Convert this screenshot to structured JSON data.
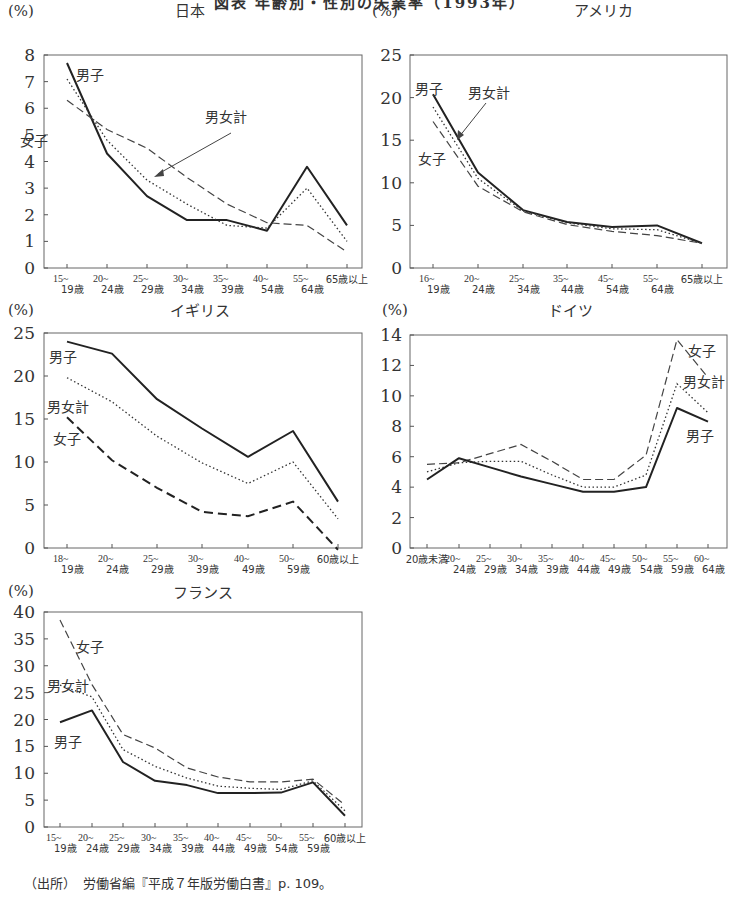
{
  "page_title": "図表 年齢別・性別の失業率（1993年）",
  "source_text": "（出所）　労働省編『平成７年版労働白書』p. 109。",
  "legend_names": {
    "male": "男子",
    "female": "女子",
    "total": "男女計"
  },
  "unit": "(%)",
  "chart_data": [
    {
      "type": "line",
      "title": "日本",
      "ylabel": "(%)",
      "ylim": [
        0,
        8
      ],
      "yticks": [
        0,
        1,
        2,
        3,
        4,
        5,
        6,
        7,
        8
      ],
      "categories": [
        "15~19歳",
        "20~24歳",
        "25~29歳",
        "30~34歳",
        "35~39歳",
        "40~54歳",
        "55~64歳",
        "65歳以上"
      ],
      "series": [
        {
          "name": "男子",
          "style": "solid",
          "values": [
            7.7,
            4.3,
            2.7,
            1.8,
            1.8,
            1.4,
            3.8,
            1.6
          ]
        },
        {
          "name": "女子",
          "style": "dashed",
          "values": [
            6.3,
            5.2,
            4.5,
            3.4,
            2.4,
            1.7,
            1.6,
            0.6
          ]
        },
        {
          "name": "男女計",
          "style": "dotted",
          "values": [
            7.1,
            4.8,
            3.3,
            2.4,
            1.6,
            1.5,
            3.0,
            1.0
          ]
        }
      ],
      "annotations": [
        "男子",
        "女子",
        "男女計 (arrow)"
      ],
      "grid": false
    },
    {
      "type": "line",
      "title": "アメリカ",
      "ylabel": "(%)",
      "ylim": [
        0,
        25
      ],
      "yticks": [
        0,
        5,
        10,
        15,
        20,
        25
      ],
      "categories": [
        "16~19歳",
        "20~24歳",
        "25~34歳",
        "35~44歳",
        "45~54歳",
        "55~64歳",
        "65歳以上"
      ],
      "series": [
        {
          "name": "男子",
          "style": "solid",
          "values": [
            20.4,
            11.2,
            6.8,
            5.4,
            4.8,
            5.0,
            2.9
          ]
        },
        {
          "name": "女子",
          "style": "dashed",
          "values": [
            17.2,
            9.6,
            6.6,
            5.1,
            4.3,
            3.8,
            2.9
          ]
        },
        {
          "name": "男女計",
          "style": "dotted",
          "values": [
            18.9,
            10.5,
            6.7,
            5.3,
            4.6,
            4.5,
            2.9
          ]
        }
      ],
      "annotations": [
        "男子",
        "女子",
        "男女計 (arrow)"
      ],
      "grid": false
    },
    {
      "type": "line",
      "title": "イギリス",
      "ylabel": "(%)",
      "ylim": [
        0,
        25
      ],
      "yticks": [
        0,
        5,
        10,
        15,
        20,
        25
      ],
      "categories": [
        "18~19歳",
        "20~24歳",
        "25~29歳",
        "30~39歳",
        "40~49歳",
        "50~59歳",
        "60歳以上"
      ],
      "series": [
        {
          "name": "男子",
          "style": "solid",
          "values": [
            24.0,
            22.6,
            17.3,
            13.9,
            10.6,
            13.6,
            5.4
          ]
        },
        {
          "name": "男女計",
          "style": "dotted",
          "values": [
            19.8,
            17.0,
            13.0,
            9.9,
            7.5,
            10.0,
            3.4
          ]
        },
        {
          "name": "女子",
          "style": "dashed",
          "values": [
            15.2,
            10.2,
            7.0,
            4.2,
            3.7,
            5.4,
            -0.2
          ]
        }
      ],
      "annotations": [
        "男子",
        "男女計",
        "女子"
      ],
      "grid": false
    },
    {
      "type": "line",
      "title": "ドイツ",
      "ylabel": "(%)",
      "ylim": [
        0,
        14
      ],
      "yticks": [
        0,
        2,
        4,
        6,
        8,
        10,
        12,
        14
      ],
      "categories": [
        "20歳未満",
        "20~24歳",
        "25~29歳",
        "30~34歳",
        "35~39歳",
        "40~44歳",
        "45~49歳",
        "50~54歳",
        "55~59歳",
        "60~64歳"
      ],
      "series": [
        {
          "name": "女子",
          "style": "dashed",
          "values": [
            5.5,
            5.6,
            6.2,
            6.8,
            5.7,
            4.5,
            4.5,
            6.1,
            13.7,
            11.2
          ]
        },
        {
          "name": "男女計",
          "style": "dotted",
          "values": [
            5.0,
            5.6,
            5.7,
            5.7,
            4.8,
            4.0,
            4.0,
            4.8,
            10.8,
            8.9
          ]
        },
        {
          "name": "男子",
          "style": "solid",
          "values": [
            4.5,
            5.9,
            5.3,
            4.7,
            4.2,
            3.7,
            3.7,
            4.0,
            9.2,
            8.3
          ]
        }
      ],
      "annotations": [
        "女子",
        "男女計",
        "男子"
      ],
      "grid": false
    },
    {
      "type": "line",
      "title": "フランス",
      "ylabel": "(%)",
      "ylim": [
        0,
        40
      ],
      "yticks": [
        0,
        5,
        10,
        15,
        20,
        25,
        30,
        35,
        40
      ],
      "categories": [
        "15~19歳",
        "20~24歳",
        "25~29歳",
        "30~34歳",
        "35~39歳",
        "40~44歳",
        "45~49歳",
        "50~54歳",
        "55~59歳",
        "60歳以上"
      ],
      "series": [
        {
          "name": "女子",
          "style": "dashed",
          "values": [
            38.5,
            26.5,
            17.2,
            14.7,
            11.0,
            9.3,
            8.4,
            8.4,
            8.9,
            4.1
          ]
        },
        {
          "name": "男女計",
          "style": "dotted",
          "values": [
            26.4,
            24.2,
            14.4,
            11.3,
            9.1,
            7.6,
            7.2,
            7.0,
            8.6,
            3.0
          ]
        },
        {
          "name": "男子",
          "style": "solid",
          "values": [
            19.5,
            21.7,
            12.1,
            8.6,
            7.8,
            6.3,
            6.3,
            6.4,
            8.3,
            2.1
          ]
        }
      ],
      "annotations": [
        "女子",
        "男女計",
        "男子"
      ],
      "grid": false
    }
  ],
  "layout": {
    "charts": [
      {
        "x0": 44,
        "x1": 362,
        "ytop": 55,
        "ybot": 268,
        "unit_x": 8,
        "unit_y": 16,
        "title_x": 175,
        "title_y": 16,
        "xticks": [
          67,
          107,
          147,
          187,
          227,
          267,
          307,
          347
        ],
        "ylabel_x": 35
      },
      {
        "x0": 410,
        "x1": 727,
        "ytop": 55,
        "ybot": 268,
        "unit_x": 372,
        "unit_y": 16,
        "title_x": 574,
        "title_y": 16,
        "xticks": [
          433,
          478,
          523,
          567,
          612,
          657,
          702
        ],
        "ylabel_x": 402
      },
      {
        "x0": 44,
        "x1": 362,
        "ytop": 333,
        "ybot": 548,
        "unit_x": 8,
        "unit_y": 315,
        "title_x": 170,
        "title_y": 316,
        "xticks": [
          67,
          112,
          157,
          202,
          248,
          293,
          338
        ],
        "ylabel_x": 35
      },
      {
        "x0": 410,
        "x1": 727,
        "ytop": 335,
        "ybot": 548,
        "unit_x": 382,
        "unit_y": 315,
        "title_x": 548,
        "title_y": 316,
        "xticks": [
          427,
          459,
          490,
          521,
          552,
          583,
          614,
          646,
          677,
          708
        ],
        "ylabel_x": 402
      },
      {
        "x0": 44,
        "x1": 362,
        "ytop": 612,
        "ybot": 827,
        "unit_x": 8,
        "unit_y": 596,
        "title_x": 173,
        "title_y": 598,
        "xticks": [
          60,
          92,
          123,
          155,
          187,
          218,
          250,
          281,
          313,
          345
        ],
        "ylabel_x": 35
      }
    ]
  }
}
